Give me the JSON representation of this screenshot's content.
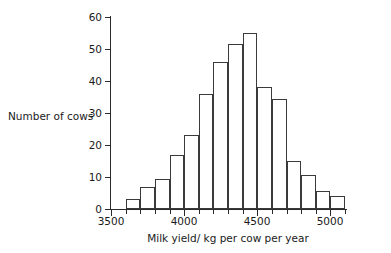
{
  "chart_data": {
    "type": "bar",
    "title": "",
    "subtitle": "",
    "xlabel": "Milk yield/ kg per cow per year",
    "ylabel": "Number of cows",
    "bin_width": 100,
    "bin_edges": [
      3600,
      3700,
      3800,
      3900,
      4000,
      4100,
      4200,
      4300,
      4400,
      4500,
      4600,
      4700,
      4800,
      4900,
      5000,
      5100
    ],
    "categories": [
      "3600-3700",
      "3700-3800",
      "3800-3900",
      "3900-4000",
      "4000-4100",
      "4100-4200",
      "4200-4300",
      "4300-4400",
      "4400-4500",
      "4500-4600",
      "4600-4700",
      "4700-4800",
      "4800-4900",
      "4900-5000",
      "5000-5100"
    ],
    "values": [
      3,
      7,
      9.5,
      17,
      23,
      36,
      46,
      51.5,
      55,
      38,
      34.5,
      15,
      10.5,
      5.5,
      4
    ],
    "xlim": [
      3500,
      5100
    ],
    "ylim": [
      0,
      60
    ],
    "y_ticks": [
      0,
      10,
      20,
      30,
      40,
      50,
      60
    ],
    "y_tick_labels": [
      "0",
      "10",
      "20",
      "30",
      "40",
      "50",
      "60"
    ],
    "x_major_ticks": [
      3500,
      4000,
      4500,
      5000
    ],
    "x_major_tick_labels": [
      "3500",
      "4000",
      "4500",
      "5000"
    ],
    "x_minor_tick_step": 100,
    "grid": false,
    "legend": null,
    "bar_fill_color": "#ffffff",
    "bar_edge_color": "#3a3a3a",
    "axis_color": "#2b2b2b",
    "background_color": "#ffffff"
  }
}
